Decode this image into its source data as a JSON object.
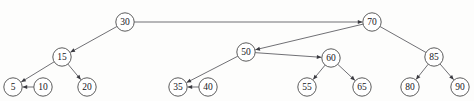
{
  "figure": {
    "background_color": "#fdfdfc",
    "node_stroke_color": "#4a4a4a",
    "node_fill_color": "#ffffff",
    "edge_color": "#56565c",
    "label_color": "#16161a",
    "width": 474,
    "height": 101,
    "node_radius": 9.2
  },
  "nodes": [
    {
      "id": "n30",
      "label": "30",
      "x": 125,
      "y": 22
    },
    {
      "id": "n70",
      "label": "70",
      "x": 372,
      "y": 22
    },
    {
      "id": "n15",
      "label": "15",
      "x": 62,
      "y": 57
    },
    {
      "id": "n50",
      "label": "50",
      "x": 246,
      "y": 52
    },
    {
      "id": "n60",
      "label": "60",
      "x": 331,
      "y": 58
    },
    {
      "id": "n85",
      "label": "85",
      "x": 434,
      "y": 57
    },
    {
      "id": "n5",
      "label": "5",
      "x": 13,
      "y": 87
    },
    {
      "id": "n10",
      "label": "10",
      "x": 43,
      "y": 87
    },
    {
      "id": "n20",
      "label": "20",
      "x": 87,
      "y": 87
    },
    {
      "id": "n35",
      "label": "35",
      "x": 178,
      "y": 87
    },
    {
      "id": "n40",
      "label": "40",
      "x": 208,
      "y": 87
    },
    {
      "id": "n55",
      "label": "55",
      "x": 307,
      "y": 87
    },
    {
      "id": "n65",
      "label": "65",
      "x": 362,
      "y": 87
    },
    {
      "id": "n80",
      "label": "80",
      "x": 410,
      "y": 87
    },
    {
      "id": "n90",
      "label": "90",
      "x": 460,
      "y": 87
    }
  ],
  "edges": [
    {
      "id": "e30-15",
      "from": "n30",
      "to": "n15",
      "arrow": true,
      "name": "edge-30-to-15"
    },
    {
      "id": "e30-70",
      "from": "n30",
      "to": "n70",
      "arrow": true,
      "name": "edge-30-to-70"
    },
    {
      "id": "e15-5",
      "from": "n15",
      "to": "n5",
      "arrow": true,
      "name": "edge-15-to-5"
    },
    {
      "id": "e15-20",
      "from": "n15",
      "to": "n20",
      "arrow": true,
      "name": "edge-15-to-20"
    },
    {
      "id": "e10-5",
      "from": "n10",
      "to": "n5",
      "arrow": true,
      "name": "edge-10-to-5"
    },
    {
      "id": "e70-50",
      "from": "n70",
      "to": "n50",
      "arrow": true,
      "name": "edge-70-to-50"
    },
    {
      "id": "e70-85",
      "from": "n70",
      "to": "n85",
      "arrow": false,
      "name": "edge-70-to-85"
    },
    {
      "id": "e50-35",
      "from": "n50",
      "to": "n35",
      "arrow": true,
      "name": "edge-50-to-35"
    },
    {
      "id": "e50-60",
      "from": "n50",
      "to": "n60",
      "arrow": true,
      "name": "edge-50-to-60"
    },
    {
      "id": "e40-35",
      "from": "n40",
      "to": "n35",
      "arrow": true,
      "name": "edge-40-to-35"
    },
    {
      "id": "e60-55",
      "from": "n60",
      "to": "n55",
      "arrow": true,
      "name": "edge-60-to-55"
    },
    {
      "id": "e60-65",
      "from": "n60",
      "to": "n65",
      "arrow": true,
      "name": "edge-60-to-65"
    },
    {
      "id": "e85-80",
      "from": "n85",
      "to": "n80",
      "arrow": true,
      "name": "edge-85-to-80"
    },
    {
      "id": "e85-90",
      "from": "n85",
      "to": "n90",
      "arrow": true,
      "name": "edge-85-to-90"
    }
  ]
}
